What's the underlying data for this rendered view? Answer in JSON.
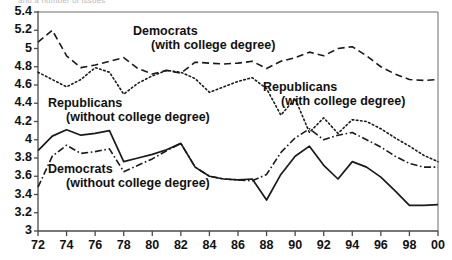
{
  "figure": {
    "top_caption_cut": "and a number of issues",
    "width": 452,
    "height": 260
  },
  "axes": {
    "y_ticks": [
      "5.4",
      "5.2",
      "5",
      "4.8",
      "4.6",
      "4.4",
      "4.2",
      "4",
      "3.8",
      "3.6",
      "3.4",
      "3.2",
      "3"
    ],
    "x_ticks": [
      "72",
      "74",
      "76",
      "78",
      "80",
      "82",
      "84",
      "86",
      "88",
      "90",
      "92",
      "94",
      "96",
      "98",
      "00"
    ]
  },
  "annotations": [
    {
      "id": "dem-college",
      "line1": "Democrats",
      "line2": "(with college degree)"
    },
    {
      "id": "rep-nocollege",
      "line1": "Republicans",
      "line2": "(without college degree)"
    },
    {
      "id": "rep-college",
      "line1": "Republicans",
      "line2": "(with college degree)"
    },
    {
      "id": "dem-nocollege",
      "line1": "Democrats",
      "line2": "(without college degree)"
    }
  ],
  "chart_data": {
    "type": "line",
    "title": "",
    "xlabel": "",
    "ylabel": "",
    "xlim": [
      1972,
      2000
    ],
    "ylim": [
      3,
      5.4
    ],
    "grid": false,
    "legend": "inline-annotations",
    "x": [
      1972,
      1973,
      1974,
      1975,
      1976,
      1977,
      1978,
      1979,
      1980,
      1981,
      1982,
      1983,
      1984,
      1985,
      1986,
      1987,
      1988,
      1989,
      1990,
      1991,
      1992,
      1993,
      1994,
      1995,
      1996,
      1997,
      1998,
      1999,
      2000
    ],
    "series": [
      {
        "name": "Democrats (with college degree)",
        "style": "dashed",
        "color": "#1a1a1a",
        "values": [
          5.07,
          5.2,
          4.92,
          4.79,
          4.82,
          4.86,
          4.9,
          4.78,
          4.72,
          4.76,
          4.73,
          4.85,
          4.84,
          4.83,
          4.84,
          4.86,
          4.78,
          4.86,
          4.9,
          4.96,
          4.92,
          5.0,
          5.02,
          4.92,
          4.8,
          4.72,
          4.66,
          4.65,
          4.66
        ]
      },
      {
        "name": "Republicans (with college degree)",
        "style": "dotted",
        "color": "#1a1a1a",
        "values": [
          4.74,
          4.66,
          4.58,
          4.66,
          4.79,
          4.74,
          4.5,
          4.62,
          4.7,
          4.76,
          4.74,
          4.67,
          4.52,
          4.58,
          4.64,
          4.68,
          4.56,
          4.27,
          4.45,
          4.08,
          4.24,
          4.07,
          4.22,
          4.2,
          4.12,
          4.02,
          3.93,
          3.83,
          3.76
        ]
      },
      {
        "name": "Republicans (without college degree)",
        "style": "solid",
        "color": "#1a1a1a",
        "values": [
          3.88,
          4.04,
          4.11,
          4.05,
          4.07,
          4.1,
          3.76,
          3.8,
          3.84,
          3.89,
          3.96,
          3.7,
          3.6,
          3.57,
          3.56,
          3.57,
          3.34,
          3.62,
          3.82,
          3.93,
          3.72,
          3.57,
          3.76,
          3.7,
          3.59,
          3.44,
          3.28,
          3.28,
          3.29
        ]
      },
      {
        "name": "Democrats (without college degree)",
        "style": "dash-dot",
        "color": "#1a1a1a",
        "values": [
          3.48,
          3.82,
          3.94,
          3.85,
          3.87,
          3.9,
          3.65,
          3.72,
          3.79,
          3.88,
          3.96,
          3.7,
          3.6,
          3.57,
          3.56,
          3.55,
          3.62,
          3.86,
          4.02,
          4.12,
          4.0,
          4.05,
          4.08,
          4.0,
          3.92,
          3.82,
          3.74,
          3.7,
          3.7
        ]
      }
    ]
  }
}
